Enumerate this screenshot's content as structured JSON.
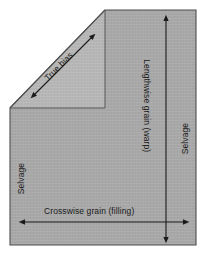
{
  "figure": {
    "background_color": "#ffffff",
    "body_fill_color": "#a8a8a8",
    "bias_triangle_fill_color": "#b6b6b6",
    "outline_color": "#4d4d4d",
    "arrow_color": "#1a1a1a",
    "text_color": "#1a1a1a"
  },
  "labels": {
    "true_bias": "True bias",
    "lengthwise_grain": "Lengthwise grain (warp)",
    "crosswise_grain": "Crosswise grain (filling)",
    "selvage_left": "Selvage",
    "selvage_right": "Selvage"
  },
  "arrows": [
    {
      "name": "true-bias-arrow",
      "orientation": "diagonal-45",
      "double_headed": true,
      "from": [
        33,
        96
      ],
      "to": [
        93,
        36
      ]
    },
    {
      "name": "lengthwise-grain-arrow",
      "orientation": "vertical",
      "double_headed": true,
      "from": [
        166,
        18
      ],
      "to": [
        166,
        240
      ]
    },
    {
      "name": "crosswise-grain-arrow",
      "orientation": "horizontal",
      "double_headed": true,
      "from": [
        22,
        222
      ],
      "to": [
        186,
        222
      ]
    }
  ],
  "shape": {
    "name": "fabric-pentagon",
    "points": "10,108 105,10 196,10 196,245 10,245",
    "bias_triangle_points": "10,108 105,10 105,108"
  }
}
